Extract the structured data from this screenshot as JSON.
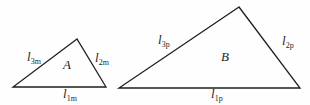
{
  "diagram": {
    "background_color": "#fefefe",
    "line_color": "#1e1e1e",
    "triangles": [
      {
        "label": "A",
        "sides": [
          {
            "symbol": "l",
            "subscript": "3m",
            "position": "left"
          },
          {
            "symbol": "l",
            "subscript": "2m",
            "position": "right"
          },
          {
            "symbol": "l",
            "subscript": "1m",
            "position": "bottom"
          }
        ]
      },
      {
        "label": "B",
        "sides": [
          {
            "symbol": "l",
            "subscript": "3p",
            "position": "left"
          },
          {
            "symbol": "l",
            "subscript": "2p",
            "position": "right"
          },
          {
            "symbol": "l",
            "subscript": "1p",
            "position": "bottom"
          }
        ]
      }
    ]
  }
}
